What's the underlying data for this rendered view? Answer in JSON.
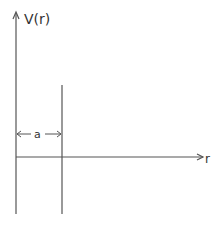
{
  "diagram": {
    "type": "potential-well-sketch",
    "y_axis": {
      "label": "V(r)"
    },
    "x_axis": {
      "label": "r"
    },
    "width_marker": {
      "label": "a"
    },
    "colors": {
      "line": "#555555",
      "text": "#333333",
      "background": "#ffffff"
    }
  }
}
